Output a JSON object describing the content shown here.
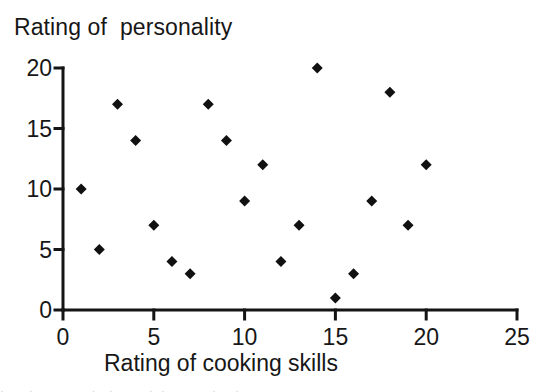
{
  "chart_data": {
    "type": "scatter",
    "title": "Rating of  personality",
    "xlabel": "Rating of cooking skills",
    "ylabel": "Rating of  personality",
    "xlim": [
      0,
      25
    ],
    "ylim": [
      0,
      20
    ],
    "xticks": [
      "0",
      "5",
      "10",
      "15",
      "20",
      "25"
    ],
    "xtick_values": [
      0,
      5,
      10,
      15,
      20,
      25
    ],
    "yticks": [
      "20",
      "15",
      "10",
      "5",
      "0"
    ],
    "ytick_values": [
      20,
      15,
      10,
      5,
      0
    ],
    "grid": false,
    "legend": false,
    "marker": "diamond",
    "marker_color": "#111111",
    "marker_size": 11,
    "series": [
      {
        "name": "ratings",
        "points": [
          {
            "x": 1,
            "y": 10
          },
          {
            "x": 2,
            "y": 5
          },
          {
            "x": 3,
            "y": 17
          },
          {
            "x": 4,
            "y": 14
          },
          {
            "x": 5,
            "y": 7
          },
          {
            "x": 6,
            "y": 4
          },
          {
            "x": 7,
            "y": 3
          },
          {
            "x": 8,
            "y": 17
          },
          {
            "x": 9,
            "y": 14
          },
          {
            "x": 10,
            "y": 9
          },
          {
            "x": 11,
            "y": 12
          },
          {
            "x": 12,
            "y": 4
          },
          {
            "x": 13,
            "y": 7
          },
          {
            "x": 14,
            "y": 20
          },
          {
            "x": 15,
            "y": 1
          },
          {
            "x": 16,
            "y": 3
          },
          {
            "x": 17,
            "y": 9
          },
          {
            "x": 18,
            "y": 18
          },
          {
            "x": 19,
            "y": 7
          },
          {
            "x": 20,
            "y": 12
          }
        ]
      }
    ]
  },
  "axis": {
    "line_color": "#141414",
    "line_width": 3
  },
  "footer": {
    "scan_remnant": "·    ·          ·  ·      · ·        ·   ·"
  }
}
